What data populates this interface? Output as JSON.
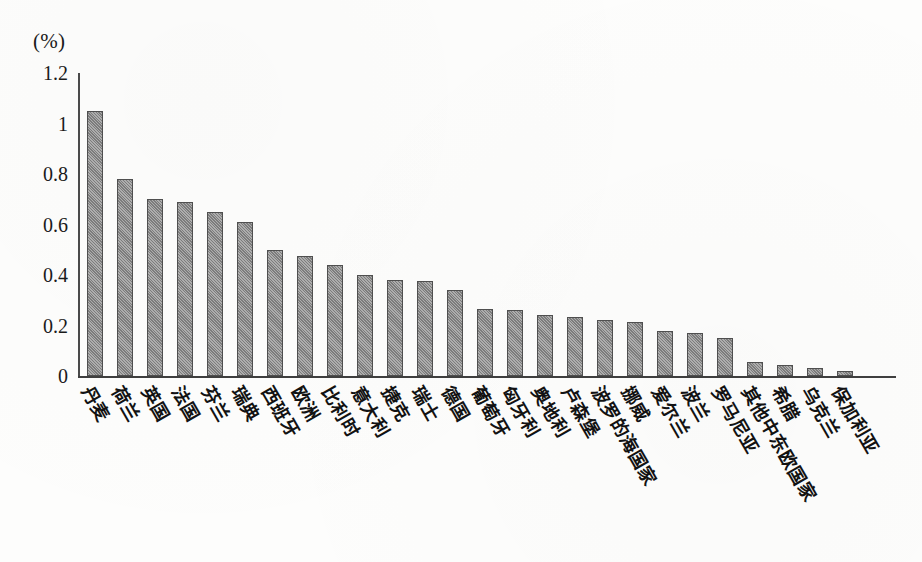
{
  "chart_data": {
    "type": "bar",
    "title": "",
    "subtitle": "",
    "units_label": "(%)",
    "xlabel": "",
    "ylabel": "(%)",
    "ylim": [
      0,
      1.2
    ],
    "yticks": [
      "0",
      "0.2",
      "0.4",
      "0.6",
      "0.8",
      "1",
      "1.2"
    ],
    "ytick_values": [
      0,
      0.2,
      0.4,
      0.6,
      0.8,
      1,
      1.2
    ],
    "grid": false,
    "legend": "none",
    "bar_color": "#8a8a8a",
    "bar_edge_color": "#4f4f4f",
    "axis_color": "#3f3f3f",
    "categories": [
      "丹麦",
      "荷兰",
      "英国",
      "法国",
      "芬兰",
      "瑞典",
      "西班牙",
      "欧洲",
      "比利时",
      "意大利",
      "捷克",
      "瑞士",
      "德国",
      "葡萄牙",
      "匈牙利",
      "奥地利",
      "卢森堡",
      "波罗的海国家",
      "挪威",
      "爱尔兰",
      "波兰",
      "罗马尼亚",
      "其他中东欧国家",
      "希腊",
      "乌克兰",
      "保加利亚"
    ],
    "values": [
      1.05,
      0.78,
      0.7,
      0.69,
      0.65,
      0.61,
      0.5,
      0.475,
      0.44,
      0.4,
      0.38,
      0.375,
      0.34,
      0.265,
      0.26,
      0.24,
      0.235,
      0.22,
      0.215,
      0.18,
      0.17,
      0.15,
      0.055,
      0.045,
      0.03,
      0.02
    ]
  }
}
